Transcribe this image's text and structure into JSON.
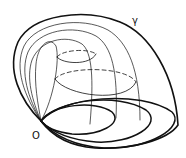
{
  "diagram": {
    "labels": {
      "origin": "O",
      "curve": "γ"
    },
    "colors": {
      "stroke": "#111111",
      "background": "#ffffff"
    }
  }
}
